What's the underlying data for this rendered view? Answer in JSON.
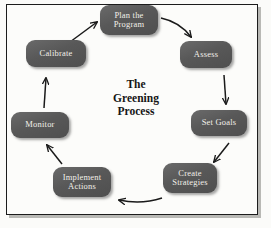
{
  "diagram": {
    "title_lines": [
      "The",
      "Greening",
      "Process"
    ],
    "border_color": "#1c1c1c",
    "background_color": "#fbfbf9",
    "node_fill_color": "#5a5a5a",
    "node_text_color": "#f2f0ea",
    "arrow_color": "#1a1a1a",
    "flow_direction": "clockwise",
    "nodes": [
      {
        "id": "plan",
        "lines": [
          "Plan the",
          "Program"
        ]
      },
      {
        "id": "assess",
        "lines": [
          "Assess"
        ]
      },
      {
        "id": "goals",
        "lines": [
          "Set Goals"
        ]
      },
      {
        "id": "create",
        "lines": [
          "Create",
          "Strategies"
        ]
      },
      {
        "id": "implement",
        "lines": [
          "Implement",
          "Actions"
        ]
      },
      {
        "id": "monitor",
        "lines": [
          "Monitor"
        ]
      },
      {
        "id": "calibrate",
        "lines": [
          "Calibrate"
        ]
      }
    ],
    "arrows": [
      {
        "id": "plan-to-assess",
        "from": "plan",
        "to": "assess",
        "shape": "curved",
        "direction": "down-right"
      },
      {
        "id": "assess-to-goals",
        "from": "assess",
        "to": "goals",
        "shape": "straight",
        "direction": "down"
      },
      {
        "id": "goals-to-create",
        "from": "goals",
        "to": "create",
        "shape": "straight",
        "direction": "down-left"
      },
      {
        "id": "create-to-implement",
        "from": "create",
        "to": "implement",
        "shape": "curved",
        "direction": "left"
      },
      {
        "id": "implement-to-monitor",
        "from": "implement",
        "to": "monitor",
        "shape": "straight",
        "direction": "up-left"
      },
      {
        "id": "monitor-to-calibrate",
        "from": "monitor",
        "to": "calibrate",
        "shape": "straight",
        "direction": "up"
      },
      {
        "id": "calibrate-to-plan",
        "from": "calibrate",
        "to": "plan",
        "shape": "straight",
        "direction": "up-right"
      }
    ]
  }
}
